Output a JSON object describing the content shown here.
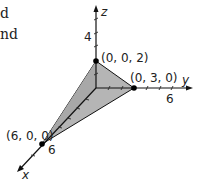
{
  "text_fragments": {
    "line1": "d",
    "line2": "nd"
  },
  "axes": {
    "x": {
      "label": "x",
      "tick_label": "6"
    },
    "y": {
      "label": "y",
      "tick_label": "6"
    },
    "z": {
      "label": "z",
      "tick_label": "4"
    }
  },
  "points": [
    {
      "label": "(0, 0, 2)"
    },
    {
      "label": "(0, 3, 0)"
    },
    {
      "label": "(6, 0, 0)"
    }
  ],
  "colors": {
    "fill": "#b8b8b8",
    "stroke": "#111111"
  }
}
